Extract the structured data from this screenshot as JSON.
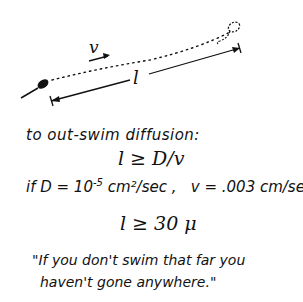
{
  "diagram": {
    "velocity_label": "v",
    "length_label": "l"
  },
  "text": {
    "heading": "to out-swim diffusion:",
    "inequality": "l ≥ D/v",
    "condition_prefix": "if D = 10",
    "condition_exponent": "-5",
    "condition_units": " cm²/sec ,",
    "velocity_condition": "v = .003 cm/sec",
    "result": "l ≥ 30 μ",
    "quote_line1": "\"If you don't swim that far you",
    "quote_line2": "haven't gone anywhere.\""
  }
}
